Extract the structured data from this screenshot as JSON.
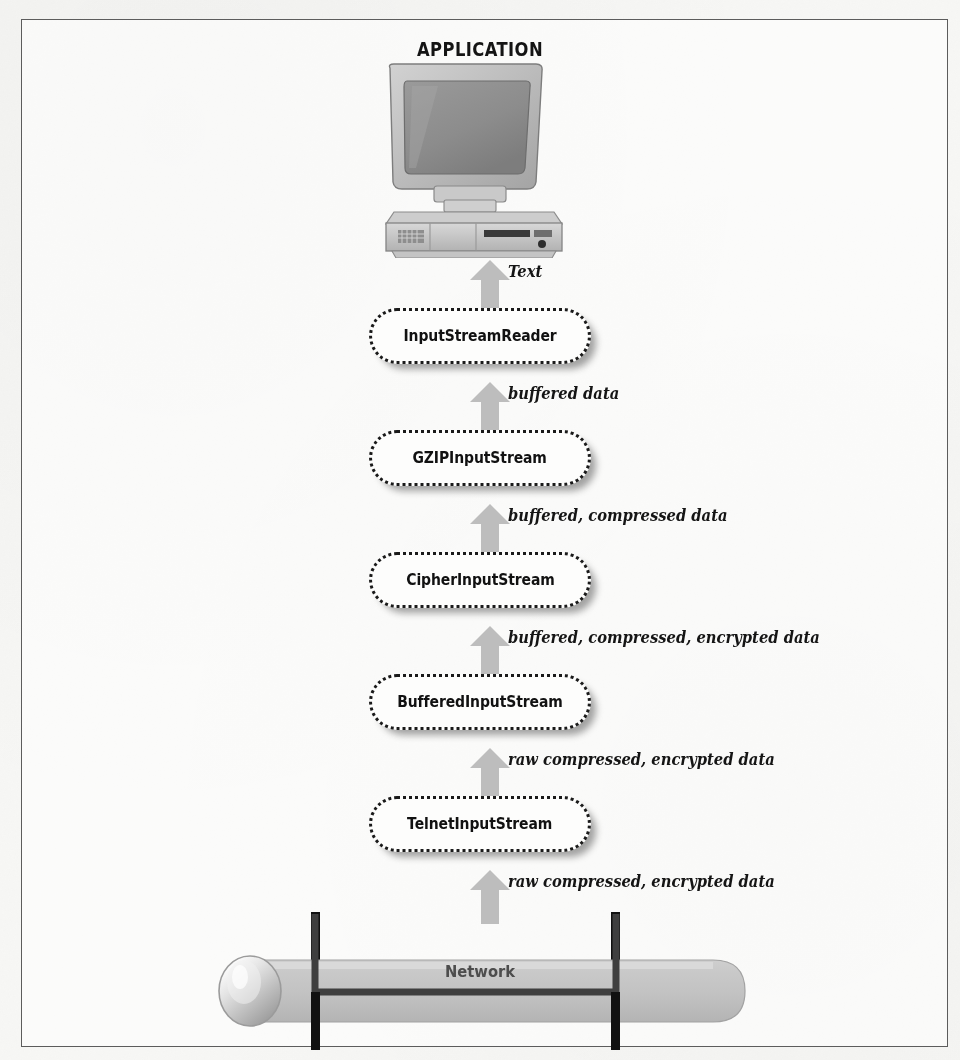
{
  "figure": {
    "title": "APPLICATION",
    "network_label": "Network",
    "icons": {
      "computer": "desktop-computer-icon",
      "network": "network-pipe-icon",
      "arrow": "up-block-arrow-icon"
    },
    "colors": {
      "page_background": "#f7f7f5",
      "frame_border": "#5c5c5c",
      "box_border": "#1a1a1a",
      "box_fill": "#fdfdfc",
      "arrow_fill": "#bdbdbd",
      "network_fill": "#c6c6c6",
      "network_text": "#4d4d4d",
      "title_text": "#141414",
      "caption_text": "#151515",
      "tap_line": "#111111"
    }
  },
  "stack": {
    "nodes": [
      {
        "id": "input-stream-reader",
        "label": "InputStreamReader",
        "top": 308
      },
      {
        "id": "gzip-input-stream",
        "label": "GZIPInputStream",
        "top": 430
      },
      {
        "id": "cipher-input-stream",
        "label": "CipherInputStream",
        "top": 552
      },
      {
        "id": "buffered-input-stream",
        "label": "BufferedInputStream",
        "top": 674
      },
      {
        "id": "telnet-input-stream",
        "label": "TelnetInputStream",
        "top": 796
      }
    ],
    "flows": [
      {
        "id": "flow-text",
        "caption": "Text",
        "arrow_top": 258,
        "caption_top": 262
      },
      {
        "id": "flow-buffered-data",
        "caption": "buffered data",
        "arrow_top": 380,
        "caption_top": 384
      },
      {
        "id": "flow-buffered-compressed",
        "caption": "buffered, compressed data",
        "arrow_top": 502,
        "caption_top": 506
      },
      {
        "id": "flow-buffered-compressed-encrypted",
        "caption": "buffered, compressed, encrypted data",
        "arrow_top": 624,
        "caption_top": 628
      },
      {
        "id": "flow-raw-upper",
        "caption": "raw compressed, encrypted data",
        "arrow_top": 746,
        "caption_top": 750
      },
      {
        "id": "flow-raw-lower",
        "caption": "raw compressed, encrypted data",
        "arrow_top": 868,
        "caption_top": 872
      }
    ]
  }
}
